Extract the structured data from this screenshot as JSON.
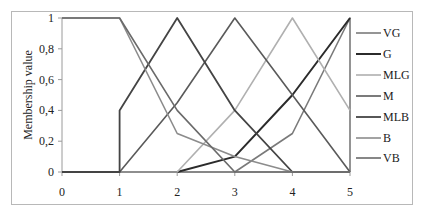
{
  "chart_data": {
    "type": "line",
    "title": "",
    "xlabel": "",
    "ylabel": "Membership value",
    "xlim": [
      0,
      5
    ],
    "ylim": [
      0,
      1
    ],
    "x_ticks": [
      "0",
      "1",
      "2",
      "3",
      "4",
      "5"
    ],
    "y_ticks": [
      "0",
      "0,2",
      "0,4",
      "0,6",
      "0,8",
      "1"
    ],
    "grid": false,
    "legend_position": "right",
    "series": [
      {
        "name": "VG",
        "color": "#7a7a7a",
        "width": 1.6,
        "points": [
          [
            0,
            0
          ],
          [
            1,
            0
          ],
          [
            2,
            0
          ],
          [
            3,
            0
          ],
          [
            4,
            0.25
          ],
          [
            5,
            1
          ],
          [
            5,
            0
          ]
        ]
      },
      {
        "name": "G",
        "color": "#2b2b2b",
        "width": 2.0,
        "points": [
          [
            0,
            0
          ],
          [
            1,
            0
          ],
          [
            2,
            0
          ],
          [
            3,
            0.1
          ],
          [
            4,
            0.5
          ],
          [
            5,
            1
          ]
        ]
      },
      {
        "name": "MLG",
        "color": "#b0b0b0",
        "width": 1.6,
        "points": [
          [
            0,
            0
          ],
          [
            1,
            0
          ],
          [
            2,
            0
          ],
          [
            3,
            0.4
          ],
          [
            4,
            1
          ],
          [
            5,
            0.4
          ]
        ]
      },
      {
        "name": "M",
        "color": "#5a5a5a",
        "width": 1.6,
        "points": [
          [
            0,
            0
          ],
          [
            1,
            0
          ],
          [
            2,
            0.45
          ],
          [
            3,
            1
          ],
          [
            4,
            0.5
          ],
          [
            5,
            0
          ]
        ]
      },
      {
        "name": "MLB",
        "color": "#444444",
        "width": 1.8,
        "points": [
          [
            0,
            0
          ],
          [
            1,
            0
          ],
          [
            1,
            0.4
          ],
          [
            2,
            1
          ],
          [
            3,
            0.4
          ],
          [
            4,
            0
          ],
          [
            5,
            0
          ]
        ]
      },
      {
        "name": "B",
        "color": "#8c8c8c",
        "width": 1.6,
        "points": [
          [
            0,
            1
          ],
          [
            1,
            1
          ],
          [
            2,
            0.25
          ],
          [
            3,
            0.1
          ],
          [
            4,
            0
          ],
          [
            5,
            0
          ]
        ]
      },
      {
        "name": "VB",
        "color": "#6a6a6a",
        "width": 1.6,
        "points": [
          [
            0,
            1
          ],
          [
            1,
            1
          ],
          [
            2,
            0.4
          ],
          [
            3,
            0
          ],
          [
            4,
            0
          ],
          [
            5,
            0
          ]
        ]
      }
    ]
  }
}
